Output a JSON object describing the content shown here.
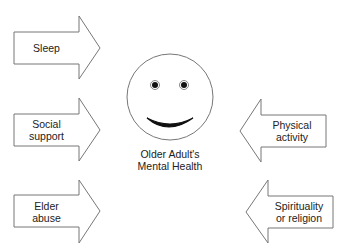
{
  "center": {
    "label_line1": "Older Adult's",
    "label_line2": "Mental Health",
    "icon": "smiley-face-icon"
  },
  "left_factors": [
    {
      "line1": "Sleep",
      "line2": ""
    },
    {
      "line1": "Social",
      "line2": "support"
    },
    {
      "line1": "Elder",
      "line2": "abuse"
    }
  ],
  "right_factors": [
    {
      "line1": "Physical",
      "line2": "activity"
    },
    {
      "line1": "Spirituality",
      "line2": "or religion"
    }
  ],
  "colors": {
    "stroke": "#666666",
    "fill": "#ffffff",
    "ink": "#111111"
  }
}
